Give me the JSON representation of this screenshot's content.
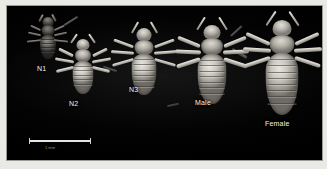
{
  "figure": {
    "kind": "photomicrograph",
    "background_color": "#000000",
    "border_color": "#e9e9e6"
  },
  "scale_bar": {
    "caption": "1 mm",
    "color": "#e6e6e3"
  },
  "specimens": [
    {
      "id": "n1",
      "label": "N1",
      "stage": "first-instar nymph",
      "relative_size": 0.38,
      "appearance": "dark, low contrast"
    },
    {
      "id": "n2",
      "label": "N2",
      "stage": "second-instar nymph",
      "relative_size": 0.55,
      "appearance": "pale grey"
    },
    {
      "id": "n3",
      "label": "N3",
      "stage": "third-instar nymph",
      "relative_size": 0.72,
      "appearance": "pale grey"
    },
    {
      "id": "male",
      "label": "Male",
      "stage": "adult male",
      "relative_size": 0.86,
      "appearance": "pale grey"
    },
    {
      "id": "female",
      "label": "Female",
      "stage": "adult female",
      "relative_size": 1.0,
      "appearance": "bright, largest"
    }
  ]
}
